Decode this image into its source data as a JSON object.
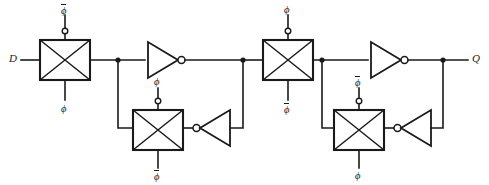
{
  "figure": {
    "background_color": "#ffffff",
    "line_color": "#1a1a1a"
  },
  "ports": {
    "input_label": "D",
    "output_label": "Q"
  },
  "clock": {
    "phi": "ϕ",
    "phi_bar": "ϕ"
  },
  "transmission_gates": [
    {
      "id": "tg1",
      "name": "master-input-gate",
      "top_label": "ϕ",
      "top_label_bar": true,
      "bottom_label": "ϕ",
      "bottom_label_bar": false
    },
    {
      "id": "tg2",
      "name": "master-feedback-gate",
      "top_label": "ϕ",
      "top_label_bar": false,
      "bottom_label": "ϕ",
      "bottom_label_bar": true
    },
    {
      "id": "tg3",
      "name": "slave-input-gate",
      "top_label": "ϕ",
      "top_label_bar": false,
      "bottom_label": "ϕ",
      "bottom_label_bar": true
    },
    {
      "id": "tg4",
      "name": "slave-feedback-gate",
      "top_label": "ϕ",
      "top_label_bar": true,
      "bottom_label": "ϕ",
      "bottom_label_bar": false
    }
  ],
  "inverters": [
    {
      "id": "inv1",
      "name": "master-forward-inverter",
      "direction": "right"
    },
    {
      "id": "inv2",
      "name": "master-feedback-inverter",
      "direction": "left"
    },
    {
      "id": "inv3",
      "name": "slave-forward-inverter",
      "direction": "right"
    },
    {
      "id": "inv4",
      "name": "slave-feedback-inverter",
      "direction": "left"
    }
  ]
}
